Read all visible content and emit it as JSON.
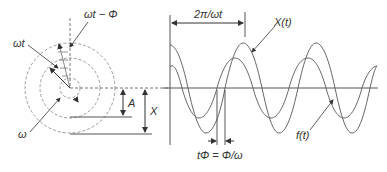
{
  "labels": {
    "omega_t_minus_phi": "ωt − Φ",
    "omega_t": "ωt",
    "omega": "ω",
    "amplitude_A": "A",
    "amplitude_X": "X",
    "period": "2π/ωt",
    "response": "X(t)",
    "force": "f(t)",
    "phase_lag": "tΦ = Φ/ω"
  },
  "colors": {
    "line": "#555555",
    "dashed": "#999999",
    "text": "#333333"
  }
}
